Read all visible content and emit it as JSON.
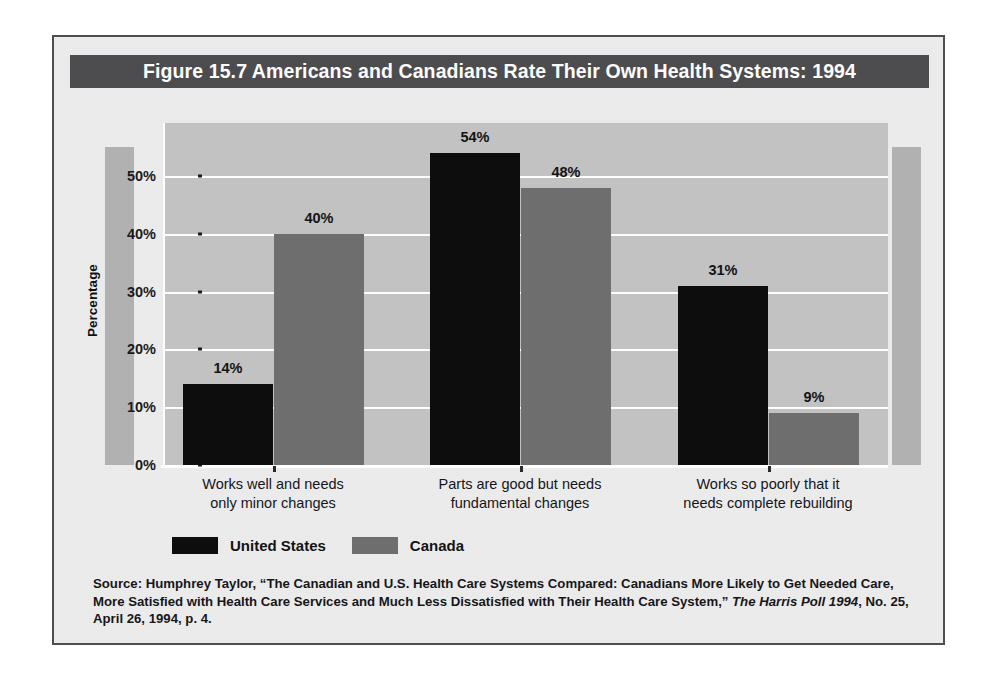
{
  "figure": {
    "title": "Figure 15.7  Americans and Canadians Rate Their Own Health Systems: 1994",
    "axis_title": "Percentage",
    "source_prefix": "Source: Humphrey Taylor, “The Canadian and U.S. Health Care Systems Compared: Canadians More Likely to Get Needed Care, More Satisfied with Health Care Services and Much Less Dissatisfied with Their Health Care System,” ",
    "source_italic": "The Harris Poll 1994",
    "source_suffix": ", No. 25, April 26, 1994, p. 4."
  },
  "colors": {
    "title_bar": "#4d4d4f",
    "frame_border": "#4e4e50",
    "page_background": "#ececed",
    "plot_background": "#c3c3c3",
    "side_band": "#b2b2b2",
    "gridline": "#ffffff",
    "united_states": "#0d0d0d",
    "canada": "#6f6f70"
  },
  "chart_data": {
    "type": "bar",
    "title": "Figure 15.7  Americans and Canadians Rate Their Own Health Systems: 1994",
    "xlabel": "",
    "ylabel": "Percentage",
    "ylim": [
      0,
      58
    ],
    "yticks": [
      0,
      10,
      20,
      30,
      40,
      50
    ],
    "ytick_labels": [
      "0%",
      "10%",
      "20%",
      "30%",
      "40%",
      "50%"
    ],
    "grid": true,
    "legend_position": "bottom-left",
    "categories": [
      "Works well and needs only minor changes",
      "Parts are good but needs fundamental changes",
      "Works so poorly that it needs complete rebuilding"
    ],
    "category_lines": [
      [
        "Works well and needs",
        "only minor changes"
      ],
      [
        "Parts are good but needs",
        "fundamental changes"
      ],
      [
        "Works so poorly that it",
        "needs complete rebuilding"
      ]
    ],
    "series": [
      {
        "name": "United States",
        "color": "#0d0d0d",
        "values": [
          14,
          54,
          31
        ],
        "labels": [
          "14%",
          "54%",
          "31%"
        ]
      },
      {
        "name": "Canada",
        "color": "#6f6f70",
        "values": [
          40,
          48,
          9
        ],
        "labels": [
          "40%",
          "48%",
          "9%"
        ]
      }
    ]
  }
}
